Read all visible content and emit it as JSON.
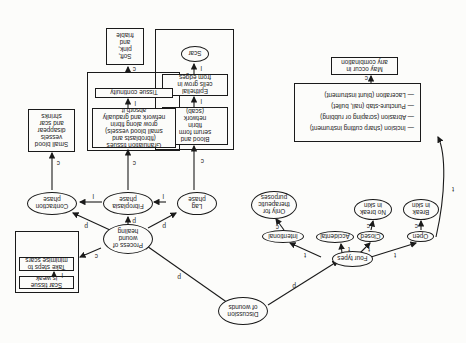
{
  "orientation": "rotated 180 degrees",
  "nodes": {
    "root": "Discussion\nof wounds",
    "healing": "Process of\nwound\nhealing",
    "types": "Four types",
    "lag": "Lag\nphase",
    "fibroplasia": "Fibroplasia\nphase",
    "contraction": "Contraction\nphase",
    "blood_serum": "Blood and\nserum form\nfibrin\nnetwork\n(scab)",
    "epithelial": "Epithelial\ncells grow in\nfrom edges",
    "scar": "Scar",
    "granulation": "Granulation tissues\n(fibroblasts and\nsmall blood vessels)\ngrow along fibrin\nnetwork and gradually\nabsorb it",
    "tissue_continuity": "Tissue continuity",
    "soft_pink": "Soft,\npink,\nand\nfriable",
    "small_vessels": "Small blood\nvessels\ndisappear\nand scar\nshrinks",
    "scar_weak": "Scar tissue\nis weak",
    "take_steps": "Take steps to\nminimise scars",
    "open": "Open",
    "closed": "Closed",
    "accidental": "Accidental",
    "intentional": "Intentional",
    "break_skin": "Break\nin skin",
    "no_break": "No break\nin skin",
    "therapeutic": "Only for\ntherapeutic\npurposes",
    "wound_list": [
      "— Incision (sharp cutting instrument)",
      "— Abrasion (scraping or rubbing)",
      "— Puncture-stab (nail, bullet)",
      "— Laceration (blunt instrument)"
    ],
    "combination": "May occur in\nany combination"
  },
  "edge_labels": {
    "root_healing": "p",
    "root_types": "p",
    "healing_lag": "p",
    "healing_fibro": "p",
    "healing_contraction": "p",
    "healing_scarweak": "c",
    "lag_fibro": "l",
    "fibro_contraction": "l",
    "lag_blood": "c",
    "blood_epith": "l",
    "epith_scar": "l",
    "fibro_gran": "c",
    "gran_tissue": "l",
    "tissue_soft": "c",
    "contraction_vessels": "c",
    "scarweak_steps": "l",
    "types_open": "t",
    "types_closed": "t",
    "types_accidental": "t",
    "types_intentional": "t",
    "open_break": "c",
    "closed_nobreak": "c",
    "intentional_therapeutic": "c",
    "open_list": "t",
    "list_combination": "c"
  }
}
